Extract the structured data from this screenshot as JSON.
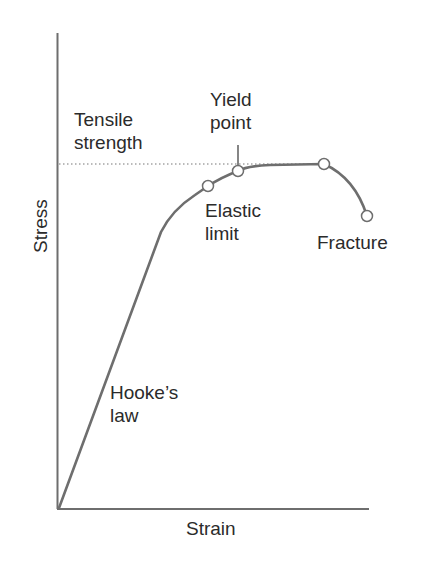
{
  "diagram": {
    "axes": {
      "x_label": "Strain",
      "y_label": "Stress"
    },
    "annotations": {
      "tensile_strength": [
        "Tensile",
        "strength"
      ],
      "yield_point": [
        "Yield",
        "point"
      ],
      "elastic_limit": [
        "Elastic",
        "limit"
      ],
      "fracture": "Fracture",
      "hookes_law": [
        "Hooke’s",
        "law"
      ]
    },
    "colors": {
      "line": "#6e6e6e",
      "text": "#2b2b2b",
      "marker_fill": "#ffffff"
    },
    "key_points": [
      {
        "name": "Elastic limit",
        "x": 208,
        "y": 186
      },
      {
        "name": "Yield point",
        "x": 238,
        "y": 171
      },
      {
        "name": "Tensile strength (max)",
        "x": 324,
        "y": 164
      },
      {
        "name": "Fracture",
        "x": 367,
        "y": 216
      }
    ]
  }
}
